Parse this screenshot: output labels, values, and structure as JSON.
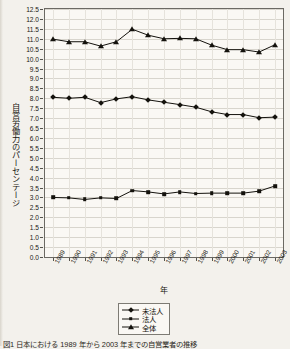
{
  "figure": {
    "background_color": "#f3f1ec",
    "plot_background_color": "#faf8f4",
    "axis_color": "#6b6963",
    "grid_color": "#d8d5cd",
    "series_color": "#14120d"
  },
  "axis_titles": {
    "y": "自営労働力のパーセンテージ",
    "x": "年"
  },
  "legend": {
    "items": [
      {
        "label": "未法人",
        "marker": "diamond-marker-icon"
      },
      {
        "label": "法人",
        "marker": "square-marker-icon"
      },
      {
        "label": "全体",
        "marker": "triangle-marker-icon"
      }
    ]
  },
  "caption": {
    "text": "図1  日本における 1989 年から 2003 年までの自営業者の推移"
  },
  "chart_data": {
    "type": "line",
    "title": "",
    "xlabel": "年",
    "ylabel": "自営労働力のパーセンテージ",
    "xlim": [
      1989,
      2003
    ],
    "ylim": [
      0.0,
      12.5
    ],
    "ytick_step": 0.5,
    "grid": true,
    "legend_position": "bottom-center",
    "categories": [
      "1989",
      "1990",
      "1991",
      "1992",
      "1993",
      "1994",
      "1995",
      "1996",
      "1997",
      "1998",
      "1999",
      "2000",
      "2001",
      "2002",
      "2003"
    ],
    "yticks": [
      "0.0",
      "0.5",
      "1.0",
      "1.5",
      "2.0",
      "2.5",
      "3.0",
      "3.5",
      "4.0",
      "4.5",
      "5.0",
      "5.5",
      "6.0",
      "6.5",
      "7.0",
      "7.5",
      "8.0",
      "8.5",
      "9.0",
      "9.5",
      "10.0",
      "10.5",
      "11.0",
      "11.5",
      "12.0",
      "12.5"
    ],
    "series": [
      {
        "name": "未法人",
        "marker": "diamond",
        "values": [
          8.05,
          8.0,
          8.05,
          7.78,
          7.97,
          8.08,
          7.92,
          7.8,
          7.68,
          7.55,
          7.32,
          7.18,
          7.18,
          7.02,
          7.05
        ]
      },
      {
        "name": "法人",
        "marker": "square",
        "values": [
          3.0,
          2.98,
          2.9,
          2.98,
          2.95,
          3.35,
          3.28,
          3.18,
          3.28,
          3.2,
          3.22,
          3.22,
          3.22,
          3.32,
          3.58
        ]
      },
      {
        "name": "全体",
        "marker": "triangle",
        "values": [
          10.98,
          10.85,
          10.85,
          10.63,
          10.85,
          11.48,
          11.18,
          11.0,
          11.02,
          11.0,
          10.68,
          10.45,
          10.45,
          10.33,
          10.7
        ]
      }
    ]
  }
}
